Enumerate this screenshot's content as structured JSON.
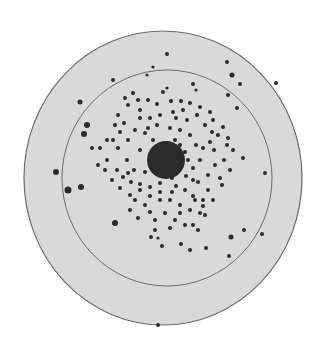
{
  "figure": {
    "background": "#ffffff",
    "dish_fill": "#d9d9d9",
    "outline_color": "#6a6a6a",
    "colony_color": "#2b2b2b",
    "outer_rim": {
      "cx": 163,
      "cy": 178,
      "rx": 139,
      "ry": 147
    },
    "inner_ring": {
      "cx": 167,
      "cy": 178,
      "rx": 105,
      "ry": 108
    },
    "central_mass": {
      "cx": 166,
      "cy": 160,
      "rx": 19,
      "ry": 19
    },
    "colonies": [
      [
        167,
        54,
        2
      ],
      [
        227,
        62,
        2
      ],
      [
        232,
        75,
        2.5
      ],
      [
        240,
        84,
        2
      ],
      [
        276,
        83,
        2
      ],
      [
        113,
        80,
        2
      ],
      [
        153,
        67,
        1.6
      ],
      [
        147,
        75,
        1.6
      ],
      [
        80,
        102,
        2.5
      ],
      [
        87,
        125,
        3
      ],
      [
        84,
        134,
        3
      ],
      [
        56,
        172,
        3
      ],
      [
        68,
        190,
        3.5
      ],
      [
        81,
        187,
        3
      ],
      [
        115,
        223,
        3
      ],
      [
        228,
        95,
        2
      ],
      [
        237,
        108,
        2
      ],
      [
        265,
        173,
        2
      ],
      [
        231,
        237,
        2.5
      ],
      [
        244,
        230,
        2
      ],
      [
        262,
        234,
        2
      ],
      [
        229,
        256,
        2
      ],
      [
        206,
        248,
        2
      ],
      [
        190,
        250,
        2
      ],
      [
        181,
        244,
        2
      ],
      [
        162,
        246,
        2
      ],
      [
        151,
        237,
        2
      ],
      [
        158,
        238,
        1.6
      ],
      [
        193,
        225,
        2
      ],
      [
        180,
        213,
        2
      ],
      [
        133,
        93,
        2
      ],
      [
        163,
        92,
        2
      ],
      [
        167,
        88,
        1.6
      ],
      [
        193,
        84,
        2
      ],
      [
        196,
        90,
        1.6
      ],
      [
        171,
        101,
        2
      ],
      [
        181,
        101,
        2
      ],
      [
        190,
        103,
        2
      ],
      [
        200,
        107,
        2
      ],
      [
        118,
        115,
        2
      ],
      [
        124,
        123,
        2
      ],
      [
        140,
        118,
        2
      ],
      [
        150,
        118,
        2
      ],
      [
        160,
        115,
        2
      ],
      [
        176,
        118,
        2
      ],
      [
        187,
        120,
        2
      ],
      [
        197,
        115,
        2
      ],
      [
        210,
        112,
        2
      ],
      [
        213,
        120,
        2
      ],
      [
        223,
        127,
        2
      ],
      [
        218,
        135,
        2
      ],
      [
        228,
        138,
        2
      ],
      [
        210,
        142,
        2
      ],
      [
        203,
        148,
        2
      ],
      [
        214,
        150,
        2
      ],
      [
        233,
        150,
        2
      ],
      [
        243,
        158,
        2
      ],
      [
        224,
        160,
        2
      ],
      [
        230,
        170,
        2
      ],
      [
        220,
        178,
        2
      ],
      [
        208,
        175,
        2
      ],
      [
        198,
        182,
        2
      ],
      [
        208,
        190,
        2
      ],
      [
        213,
        200,
        2
      ],
      [
        222,
        185,
        2
      ],
      [
        203,
        200,
        2
      ],
      [
        193,
        196,
        2
      ],
      [
        185,
        190,
        2
      ],
      [
        176,
        186,
        2
      ],
      [
        160,
        183,
        2
      ],
      [
        150,
        187,
        2
      ],
      [
        140,
        184,
        2
      ],
      [
        131,
        182,
        2
      ],
      [
        123,
        177,
        2
      ],
      [
        117,
        170,
        2
      ],
      [
        107,
        160,
        2
      ],
      [
        100,
        148,
        2
      ],
      [
        92,
        148,
        2
      ],
      [
        107,
        140,
        2
      ],
      [
        118,
        148,
        2
      ],
      [
        127,
        160,
        2
      ],
      [
        134,
        170,
        2
      ],
      [
        145,
        172,
        2
      ],
      [
        150,
        160,
        1.6
      ],
      [
        140,
        150,
        2
      ],
      [
        128,
        140,
        2
      ],
      [
        135,
        130,
        2
      ],
      [
        145,
        133,
        2
      ],
      [
        153,
        140,
        2
      ],
      [
        148,
        128,
        2
      ],
      [
        157,
        125,
        2
      ],
      [
        170,
        128,
        2
      ],
      [
        180,
        130,
        2
      ],
      [
        190,
        135,
        2
      ],
      [
        196,
        145,
        2
      ],
      [
        200,
        160,
        2
      ],
      [
        193,
        168,
        2
      ],
      [
        186,
        176,
        2
      ],
      [
        172,
        178,
        2
      ],
      [
        160,
        175,
        2
      ],
      [
        150,
        196,
        2
      ],
      [
        160,
        200,
        2
      ],
      [
        170,
        200,
        2
      ],
      [
        180,
        205,
        2
      ],
      [
        190,
        210,
        2
      ],
      [
        200,
        213,
        2
      ],
      [
        205,
        215,
        2
      ],
      [
        145,
        205,
        2
      ],
      [
        135,
        200,
        2
      ],
      [
        130,
        210,
        2
      ],
      [
        138,
        218,
        2
      ],
      [
        150,
        212,
        2
      ],
      [
        155,
        220,
        2
      ],
      [
        165,
        213,
        2
      ],
      [
        175,
        220,
        2
      ],
      [
        130,
        195,
        2
      ],
      [
        120,
        188,
        2
      ],
      [
        105,
        170,
        2
      ],
      [
        98,
        165,
        2
      ],
      [
        185,
        152,
        2
      ],
      [
        180,
        145,
        2
      ],
      [
        175,
        140,
        2
      ],
      [
        188,
        160,
        2
      ],
      [
        193,
        180,
        2
      ],
      [
        215,
        165,
        2
      ],
      [
        227,
        145,
        2
      ],
      [
        212,
        132,
        2
      ],
      [
        205,
        125,
        2
      ],
      [
        120,
        132,
        2
      ],
      [
        113,
        140,
        2
      ],
      [
        128,
        105,
        2
      ],
      [
        140,
        110,
        2
      ],
      [
        183,
        110,
        2
      ],
      [
        173,
        112,
        2
      ],
      [
        157,
        104,
        2
      ],
      [
        148,
        100,
        2
      ],
      [
        138,
        100,
        2
      ],
      [
        125,
        98,
        2
      ],
      [
        115,
        125,
        2
      ],
      [
        160,
        192,
        2
      ],
      [
        172,
        192,
        2
      ],
      [
        203,
        206,
        2
      ],
      [
        195,
        200,
        2
      ],
      [
        140,
        190,
        2
      ],
      [
        128,
        173,
        2
      ],
      [
        112,
        180,
        2
      ],
      [
        155,
        230,
        2
      ],
      [
        170,
        228,
        2
      ],
      [
        185,
        225,
        2
      ],
      [
        198,
        230,
        2
      ],
      [
        158,
        325,
        2
      ]
    ]
  }
}
